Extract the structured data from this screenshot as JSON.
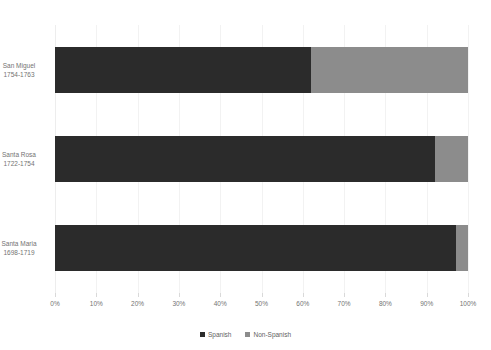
{
  "chart_data": {
    "type": "bar",
    "orientation": "horizontal",
    "stacked": true,
    "normalized_percent": true,
    "title": "",
    "subtitle": "",
    "xlabel": "",
    "ylabel": "",
    "xlim": [
      0,
      100
    ],
    "grid": true,
    "legend_position": "bottom-center",
    "categories": [
      "San Miguel\n1754-1763",
      "Santa Rosa\n1722-1754",
      "Santa Maria\n1698-1719"
    ],
    "category_lines": [
      [
        "San Miguel",
        "1754-1763"
      ],
      [
        "Santa Rosa",
        "1722-1754"
      ],
      [
        "Santa Maria",
        "1698-1719"
      ]
    ],
    "series": [
      {
        "name": "Spanish",
        "color": "#2b2b2b",
        "values": [
          62,
          92,
          97
        ]
      },
      {
        "name": "Non-Spanish",
        "color": "#8c8c8c",
        "values": [
          38,
          8,
          3
        ]
      }
    ],
    "xticks": [
      0,
      10,
      20,
      30,
      40,
      50,
      60,
      70,
      80,
      90,
      100
    ],
    "xticklabels": [
      "0%",
      "10%",
      "20%",
      "30%",
      "40%",
      "50%",
      "60%",
      "70%",
      "80%",
      "90%",
      "100%"
    ]
  },
  "legend": {
    "items": [
      {
        "label": "Spanish",
        "marker": "square-marker-icon",
        "color": "#2b2b2b"
      },
      {
        "label": "Non-Spanish",
        "marker": "square-marker-icon",
        "color": "#8c8c8c"
      }
    ]
  },
  "colors": {
    "spanish": "#2b2b2b",
    "non_spanish": "#8c8c8c",
    "gridline": "#f2f2f2",
    "text": "#737373",
    "background": "#ffffff"
  }
}
